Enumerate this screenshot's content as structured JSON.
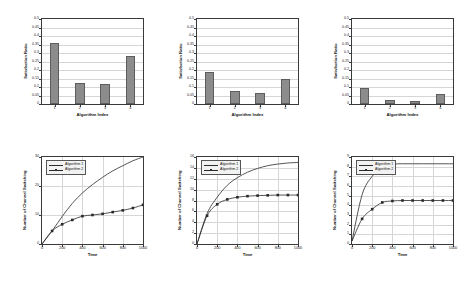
{
  "figure": {
    "layout": "2 rows x 3 columns",
    "background": "#ffffff",
    "bar_color": "#8c8c8c",
    "line_color": "#2a2a2a",
    "grid_color": "#d6d6d6"
  },
  "chart_data": [
    {
      "id": "bar-chart-1",
      "type": "bar",
      "title": "",
      "xlabel": "Algorithm Index",
      "ylabel": "Satisfaction Ratio",
      "categories": [
        "1",
        "2",
        "3",
        "4"
      ],
      "values": [
        0.36,
        0.125,
        0.115,
        0.28
      ],
      "ylim": [
        0,
        0.5
      ],
      "yticks": [
        "0",
        "0.05",
        "0.1",
        "0.15",
        "0.2",
        "0.25",
        "0.3",
        "0.35",
        "0.4",
        "0.45",
        "0.5"
      ],
      "ytick_values": [
        0,
        0.05,
        0.1,
        0.15,
        0.2,
        0.25,
        0.3,
        0.35,
        0.4,
        0.45,
        0.5
      ],
      "grid": true,
      "legend": ""
    },
    {
      "id": "bar-chart-2",
      "type": "bar",
      "title": "",
      "xlabel": "Algorithm Index",
      "ylabel": "Satisfaction Ratio",
      "categories": [
        "1",
        "2",
        "3",
        "4"
      ],
      "values": [
        0.19,
        0.077,
        0.062,
        0.15
      ],
      "ylim": [
        0,
        0.5
      ],
      "yticks": [
        "0",
        "0.05",
        "0.1",
        "0.15",
        "0.2",
        "0.25",
        "0.3",
        "0.35",
        "0.4",
        "0.45",
        "0.5"
      ],
      "ytick_values": [
        0,
        0.05,
        0.1,
        0.15,
        0.2,
        0.25,
        0.3,
        0.35,
        0.4,
        0.45,
        0.5
      ],
      "grid": true,
      "legend": ""
    },
    {
      "id": "bar-chart-3",
      "type": "bar",
      "title": "",
      "xlabel": "Algorithm Index",
      "ylabel": "Satisfaction Ratio",
      "categories": [
        "1",
        "2",
        "3",
        "4"
      ],
      "values": [
        0.095,
        0.025,
        0.02,
        0.06
      ],
      "ylim": [
        0,
        0.5
      ],
      "yticks": [
        "0",
        "0.05",
        "0.1",
        "0.15",
        "0.2",
        "0.25",
        "0.3",
        "0.35",
        "0.4",
        "0.45",
        "0.5"
      ],
      "ytick_values": [
        0,
        0.05,
        0.1,
        0.15,
        0.2,
        0.25,
        0.3,
        0.35,
        0.4,
        0.45,
        0.5
      ],
      "grid": true,
      "legend": ""
    },
    {
      "id": "line-chart-1",
      "type": "line",
      "title": "",
      "xlabel": "Time",
      "ylabel": "Number of Channel Switching",
      "xlim": [
        0,
        1000
      ],
      "ylim": [
        0,
        30
      ],
      "xticks": [
        "0",
        "200",
        "400",
        "600",
        "800",
        "1000"
      ],
      "xtick_values": [
        0,
        200,
        400,
        600,
        800,
        1000
      ],
      "yticks": [
        "0",
        "10",
        "20",
        "30"
      ],
      "ytick_values": [
        0,
        10,
        20,
        30
      ],
      "grid": true,
      "legend_position": "top-left",
      "x": [
        0,
        100,
        200,
        300,
        400,
        500,
        600,
        700,
        800,
        900,
        1000
      ],
      "series": [
        {
          "name": "Algorithm 1",
          "marker": "none",
          "values": [
            0,
            4.5,
            9.5,
            14.0,
            17.6,
            20.5,
            23.0,
            25.2,
            27.0,
            28.7,
            30.0
          ]
        },
        {
          "name": "Algorithm 2",
          "marker": "square",
          "values": [
            0,
            4.5,
            6.8,
            8.3,
            9.6,
            10.0,
            10.4,
            11.0,
            11.6,
            12.4,
            13.5
          ]
        }
      ]
    },
    {
      "id": "line-chart-2",
      "type": "line",
      "title": "",
      "xlabel": "Time",
      "ylabel": "Number of Channel Switching",
      "xlim": [
        0,
        1000
      ],
      "ylim": [
        0,
        16
      ],
      "xticks": [
        "0",
        "200",
        "400",
        "600",
        "800",
        "1000"
      ],
      "xtick_values": [
        0,
        200,
        400,
        600,
        800,
        1000
      ],
      "yticks": [
        "0",
        "2",
        "4",
        "6",
        "8",
        "10",
        "12",
        "14",
        "16"
      ],
      "ytick_values": [
        0,
        2,
        4,
        6,
        8,
        10,
        12,
        14,
        16
      ],
      "grid": true,
      "legend_position": "top-left",
      "x": [
        0,
        100,
        200,
        300,
        400,
        500,
        600,
        700,
        800,
        900,
        1000
      ],
      "series": [
        {
          "name": "Algorithm 1",
          "marker": "none",
          "values": [
            0,
            5.6,
            8.6,
            10.8,
            12.2,
            13.2,
            13.9,
            14.4,
            14.7,
            14.9,
            15.0
          ]
        },
        {
          "name": "Algorithm 2",
          "marker": "square",
          "values": [
            0,
            5.2,
            7.3,
            8.2,
            8.6,
            8.8,
            8.9,
            8.95,
            9.0,
            9.0,
            9.0
          ]
        }
      ]
    },
    {
      "id": "line-chart-3",
      "type": "line",
      "title": "",
      "xlabel": "Time",
      "ylabel": "Number of Channel Switching",
      "xlim": [
        0,
        1000
      ],
      "ylim": [
        0,
        9
      ],
      "xticks": [
        "0",
        "200",
        "400",
        "600",
        "800",
        "1000"
      ],
      "xtick_values": [
        0,
        200,
        400,
        600,
        800,
        1000
      ],
      "yticks": [
        "0",
        "1",
        "2",
        "3",
        "4",
        "5",
        "6",
        "7",
        "8",
        "9"
      ],
      "ytick_values": [
        0,
        1,
        2,
        3,
        4,
        5,
        6,
        7,
        8,
        9
      ],
      "grid": true,
      "legend_position": "top-left",
      "x": [
        0,
        100,
        200,
        300,
        400,
        500,
        600,
        700,
        800,
        900,
        1000
      ],
      "series": [
        {
          "name": "Algorithm 1",
          "marker": "none",
          "values": [
            0.3,
            5.1,
            7.0,
            7.9,
            8.25,
            8.3,
            8.3,
            8.3,
            8.3,
            8.3,
            8.3
          ]
        },
        {
          "name": "Algorithm 2",
          "marker": "square",
          "values": [
            0.3,
            2.6,
            3.6,
            4.3,
            4.45,
            4.5,
            4.5,
            4.5,
            4.5,
            4.5,
            4.5
          ]
        }
      ]
    }
  ]
}
